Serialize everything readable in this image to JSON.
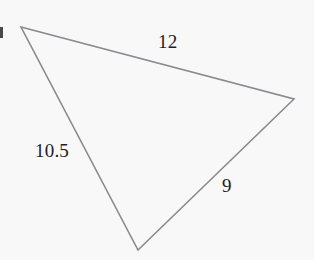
{
  "figure": {
    "kind": "geometry-diagram",
    "shape": "triangle",
    "background_color": "#f8f8f9",
    "stroke_color": "#8a8a8e",
    "stroke_width": 1.6,
    "label_color": "#1d1d1f",
    "vertices": {
      "top_left": {
        "x": 21,
        "y": 27
      },
      "right": {
        "x": 294,
        "y": 99
      },
      "bottom": {
        "x": 138,
        "y": 250
      }
    },
    "labels": {
      "top_side": "12",
      "left_side": "10.5",
      "right_side": "9"
    },
    "edge_mark_label": ""
  },
  "chart_data": {
    "type": "diagram",
    "title": "",
    "shape": "triangle",
    "sides": [
      {
        "name": "top",
        "label": "12",
        "value": 12,
        "from": "top_left",
        "to": "right"
      },
      {
        "name": "left",
        "label": "10.5",
        "value": 10.5,
        "from": "top_left",
        "to": "bottom"
      },
      {
        "name": "right",
        "label": "9",
        "value": 9,
        "from": "bottom",
        "to": "right"
      }
    ],
    "points": [
      {
        "name": "top_left",
        "x": 21,
        "y": 27
      },
      {
        "name": "right",
        "x": 294,
        "y": 99
      },
      {
        "name": "bottom",
        "x": 138,
        "y": 250
      }
    ]
  }
}
